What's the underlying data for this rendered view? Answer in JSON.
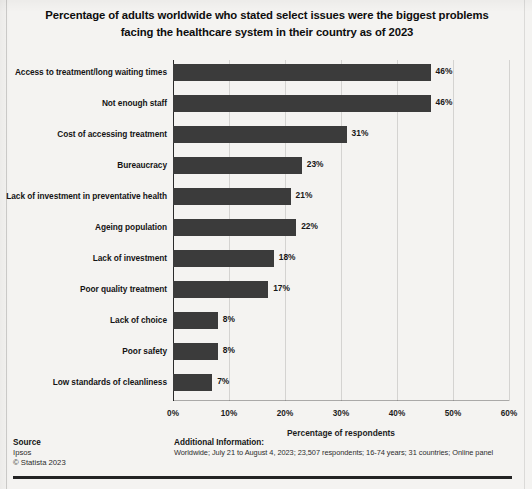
{
  "chart_data": {
    "type": "bar",
    "orientation": "horizontal",
    "title": "Percentage of adults worldwide who stated select issues were the biggest problems facing the healthcare system in their country as of 2023",
    "title_lines": [
      "Percentage of adults worldwide who stated select issues were the biggest problems",
      "facing the healthcare system in their country as of 2023"
    ],
    "categories": [
      "Access to treatment/long waiting times",
      "Not enough staff",
      "Cost of accessing treatment",
      "Bureaucracy",
      "Lack of investment in preventative health",
      "Ageing population",
      "Lack of investment",
      "Poor quality treatment",
      "Lack of choice",
      "Poor safety",
      "Low standards of cleanliness"
    ],
    "values": [
      46,
      46,
      31,
      23,
      21,
      22,
      18,
      17,
      8,
      8,
      7
    ],
    "value_labels": [
      "46%",
      "46%",
      "31%",
      "23%",
      "21%",
      "22%",
      "18%",
      "17%",
      "8%",
      "8%",
      "7%"
    ],
    "xlabel": "Percentage of respondents",
    "ylabel": "",
    "xlim": [
      0,
      60
    ],
    "xticks": [
      0,
      10,
      20,
      30,
      40,
      50,
      60
    ],
    "xtick_labels": [
      "0%",
      "10%",
      "20%",
      "30%",
      "40%",
      "50%",
      "60%"
    ],
    "grid": true,
    "legend": false,
    "bar_color": "#3b3b3b",
    "background_color": "#f4f3f1"
  },
  "footer": {
    "source_heading": "Source",
    "source_name": "Ipsos",
    "copyright": "© Statista 2023",
    "additional_heading": "Additional Information:",
    "additional_text": "Worldwide; July 21 to August 4, 2023; 23,507 respondents; 16-74 years; 31 countries; Online panel"
  }
}
